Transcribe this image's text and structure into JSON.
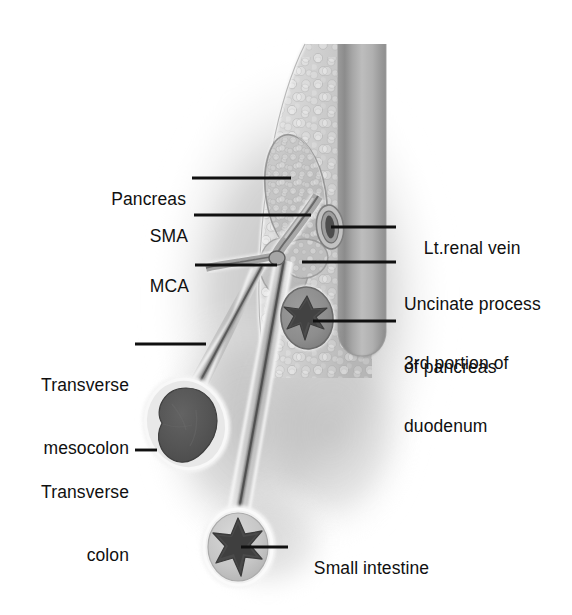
{
  "figure": {
    "type": "anatomical-illustration",
    "width": 572,
    "height": 615,
    "background_color": "#ffffff",
    "palette": {
      "ink": "#101010",
      "tissue_light": "#d2d2d2",
      "tissue_mid": "#b4b4b4",
      "tissue_dark": "#8a8a8a",
      "vessel_wall": "#6e6e6e",
      "lumen_dark": "#4a4a4a",
      "organ_dark": "#555555",
      "highlight": "#f2f2f2",
      "shadow": "#c0c0c0"
    }
  },
  "labels": [
    {
      "id": "pancreas",
      "text": "Pancreas",
      "side": "left",
      "lines": [
        "Pancreas"
      ],
      "text_x": 106,
      "text_y": 168,
      "leader": {
        "x1": 192,
        "y1": 178,
        "x2": 291,
        "y2": 178
      }
    },
    {
      "id": "sma",
      "text": "SMA",
      "side": "left",
      "lines": [
        "SMA"
      ],
      "text_x": 142,
      "text_y": 205,
      "leader": {
        "x1": 194,
        "y1": 215,
        "x2": 311,
        "y2": 215
      }
    },
    {
      "id": "mca",
      "text": "MCA",
      "side": "left",
      "lines": [
        "MCA"
      ],
      "text_x": 140,
      "text_y": 255,
      "leader": {
        "x1": 195,
        "y1": 265,
        "x2": 277,
        "y2": 265
      }
    },
    {
      "id": "transverse-mesocolon",
      "text": "Transverse mesocolon",
      "side": "left",
      "lines": [
        "Transverse",
        "mesocolon"
      ],
      "text_x": 40,
      "text_y": 333,
      "leader": {
        "x1": 135,
        "y1": 344,
        "x2": 206,
        "y2": 344
      }
    },
    {
      "id": "transverse-colon",
      "text": "Transverse colon",
      "side": "left",
      "lines": [
        "Transverse",
        "colon"
      ],
      "text_x": 40,
      "text_y": 440,
      "leader": {
        "x1": 135,
        "y1": 450,
        "x2": 157,
        "y2": 450
      }
    },
    {
      "id": "lt-renal-vein",
      "text": "Lt.renal vein",
      "side": "right",
      "lines": [
        "Lt.renal vein"
      ],
      "text_x": 404,
      "text_y": 217,
      "leader": {
        "x1": 331,
        "y1": 227,
        "x2": 396,
        "y2": 227
      }
    },
    {
      "id": "uncinate-process",
      "text": "Uncinate process of pancreas",
      "side": "right",
      "lines": [
        "Uncinate process",
        "of pancreas"
      ],
      "text_x": 404,
      "text_y": 252,
      "leader": {
        "x1": 302,
        "y1": 262,
        "x2": 396,
        "y2": 262
      }
    },
    {
      "id": "third-portion-duodenum",
      "text": "3rd portion of duodenum",
      "side": "right",
      "lines": [
        "3rd portion of",
        "duodenum"
      ],
      "text_x": 404,
      "text_y": 311,
      "leader": {
        "x1": 313,
        "y1": 321,
        "x2": 396,
        "y2": 321
      }
    },
    {
      "id": "small-intestine",
      "text": "Small intestine",
      "side": "right",
      "lines": [
        "Small intestine"
      ],
      "text_x": 294,
      "text_y": 537,
      "leader": {
        "x1": 241,
        "y1": 547,
        "x2": 288,
        "y2": 547
      }
    }
  ],
  "structures": [
    {
      "id": "great-vessel-column",
      "name": "great vessel (vertical column)"
    },
    {
      "id": "retroperitoneal-tissue",
      "name": "retroperitoneal fatty tissue"
    },
    {
      "id": "pancreas-body",
      "name": "pancreas body"
    },
    {
      "id": "sma-trunk",
      "name": "superior mesenteric artery trunk"
    },
    {
      "id": "mca-branch",
      "name": "middle colic artery branch"
    },
    {
      "id": "mesentery-sheet-small-bowel",
      "name": "small bowel mesentery"
    },
    {
      "id": "mesocolon-sheet",
      "name": "transverse mesocolon sheet"
    },
    {
      "id": "duodenum-third-part",
      "name": "third portion of duodenum"
    },
    {
      "id": "transverse-colon-mass",
      "name": "transverse colon"
    },
    {
      "id": "small-intestine-loop",
      "name": "small intestine loop"
    },
    {
      "id": "renal-vein-ostium",
      "name": "left renal vein ostium"
    }
  ]
}
